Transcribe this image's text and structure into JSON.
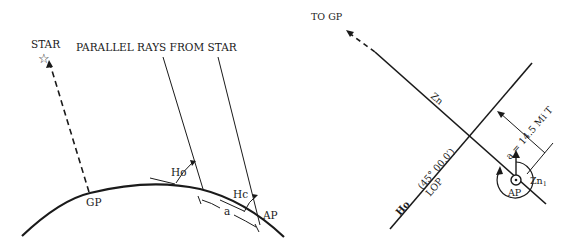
{
  "left_figure": {
    "star_label": "STAR",
    "rays_label": "PARALLEL RAYS FROM STAR",
    "gp_label": "GP",
    "ho_label": "Ho",
    "hc_label": "Hc",
    "a_label": "a",
    "ap_label": "AP",
    "star_icon": "☆"
  },
  "right_figure": {
    "to_gp_label": "TO GP",
    "zn_label": "Zn",
    "distance_label": "a = 14.5  Mi  T",
    "ho_label": "Ho",
    "ho_value_label": "(45°  00.0′)",
    "lop_label": "LOP",
    "ap_label": "AP",
    "zn1_label": "Zn",
    "zn1_subscript": "1"
  }
}
